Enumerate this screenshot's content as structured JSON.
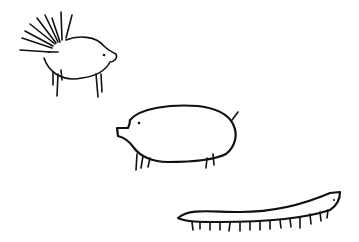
{
  "scene": {
    "background": "#ffffff",
    "ink_color": "#111111",
    "figures": [
      {
        "name": "porcupine",
        "description": "Hand-drawn porcupine with spiky quills, facing right"
      },
      {
        "name": "pig",
        "description": "Hand-drawn pig with short legs and small tail, facing left"
      },
      {
        "name": "centipede",
        "description": "Hand-drawn long thin centipede-like creature with many legs"
      }
    ]
  }
}
